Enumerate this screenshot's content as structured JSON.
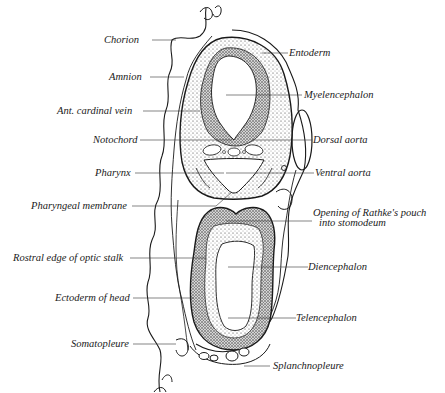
{
  "figure": {
    "ink_color": "#1a1a1a",
    "background": "#ffffff"
  },
  "labels_left": [
    {
      "id": "chorion",
      "text": "Chorion"
    },
    {
      "id": "amnion",
      "text": "Amnion"
    },
    {
      "id": "ant-cardinal-vein",
      "text": "Ant. cardinal vein"
    },
    {
      "id": "notochord",
      "text": "Notochord"
    },
    {
      "id": "pharynx",
      "text": "Pharynx"
    },
    {
      "id": "pharyngeal-membrane",
      "text": "Pharyngeal membrane"
    },
    {
      "id": "rostral-edge-optic-stalk",
      "text": "Rostral edge of optic stalk"
    },
    {
      "id": "ectoderm-of-head",
      "text": "Ectoderm of head"
    },
    {
      "id": "somatopleure",
      "text": "Somatopleure"
    }
  ],
  "labels_right": [
    {
      "id": "entoderm",
      "text": "Entoderm"
    },
    {
      "id": "myelencephalon",
      "text": "Myelencephalon"
    },
    {
      "id": "dorsal-aorta",
      "text": "Dorsal aorta"
    },
    {
      "id": "ventral-aorta",
      "text": "Ventral aorta"
    },
    {
      "id": "rathkes-pouch",
      "text": "Opening of Rathke's pouch",
      "text2": "into stomodeum"
    },
    {
      "id": "diencephalon",
      "text": "Diencephalon"
    },
    {
      "id": "telencephalon",
      "text": "Telencephalon"
    },
    {
      "id": "splanchnopleure",
      "text": "Splanchnopleure"
    }
  ]
}
